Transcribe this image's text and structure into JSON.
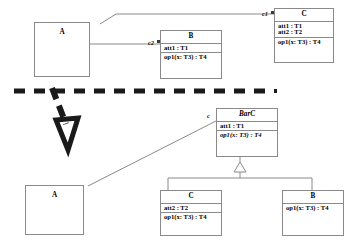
{
  "diagram": {
    "separator": {
      "style": "thick-dashed",
      "color": "#1a1a1a"
    },
    "transform_arrow": {
      "direction": "down-right",
      "style": "thick-dashed-arrow",
      "color": "#1a1a1a"
    }
  },
  "before": {
    "classA": {
      "name": "A"
    },
    "classB": {
      "name": "B",
      "attributes": [
        "att1 : T1"
      ],
      "operations": [
        "op1(x: T3) : T4"
      ]
    },
    "classC": {
      "name": "C",
      "attributes": [
        "att1 : T1",
        "att2 : T2"
      ],
      "operations": [
        "op1(x: T3) : T4"
      ]
    },
    "edges": [
      {
        "label": "c1",
        "from": "A",
        "to": "C"
      },
      {
        "label": "c2",
        "from": "A",
        "to": "B"
      }
    ]
  },
  "after": {
    "classA": {
      "name": "A"
    },
    "classBarC": {
      "name": "BarC",
      "abstract": true,
      "attributes": [
        "att1 : T1"
      ],
      "operations": [
        "op1(x: T3) : T4"
      ],
      "operations_abstract": true
    },
    "classC": {
      "name": "C",
      "attributes": [
        "att2 : T2"
      ],
      "operations": [
        "op1(x: T3) : T4"
      ]
    },
    "classB": {
      "name": "B",
      "attributes": [],
      "operations": [
        "op1(x: T3) : T4"
      ]
    },
    "edges": [
      {
        "label": "c",
        "from": "A",
        "to": "BarC"
      }
    ],
    "generalizations": [
      {
        "from": "C",
        "to": "BarC"
      },
      {
        "from": "B",
        "to": "BarC"
      }
    ]
  }
}
